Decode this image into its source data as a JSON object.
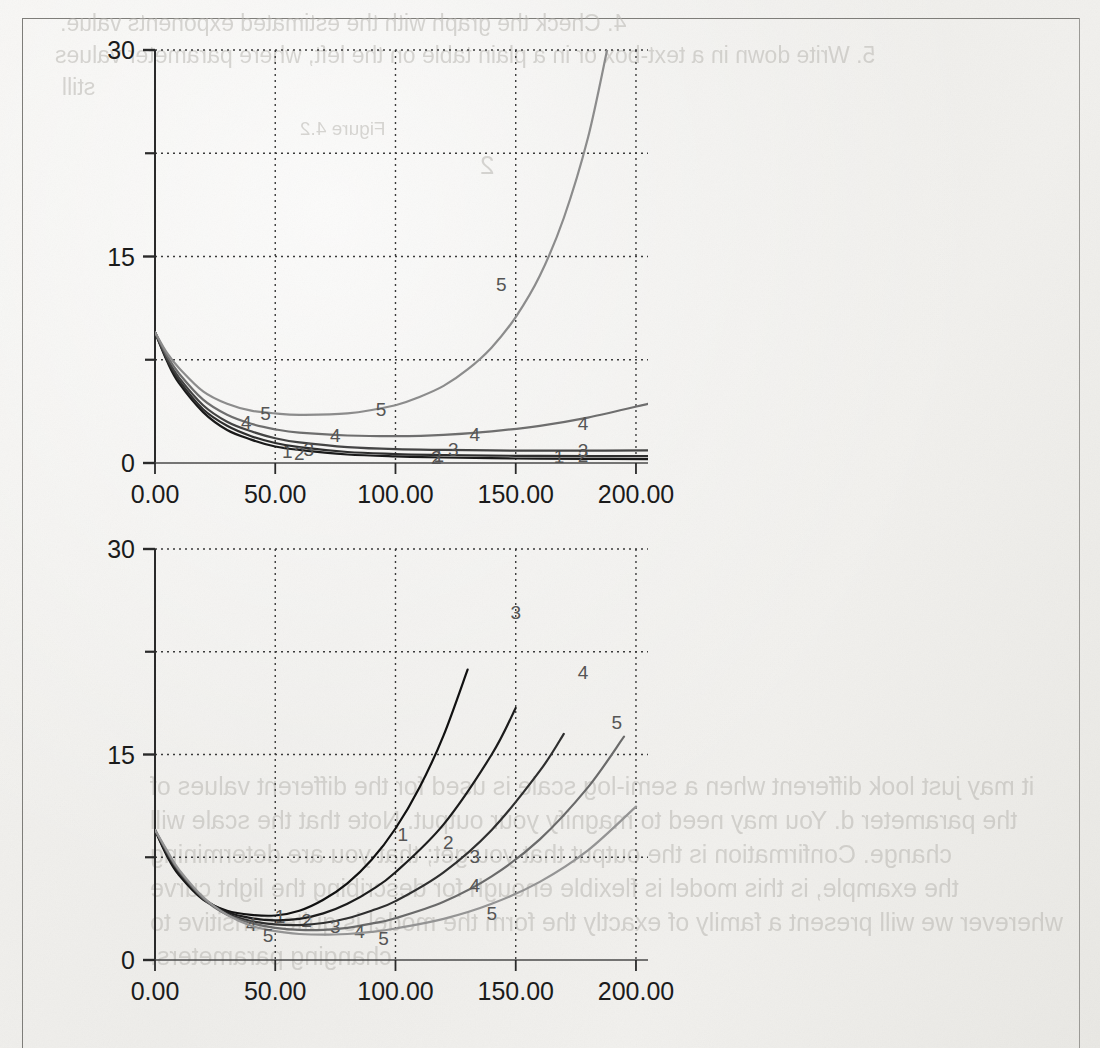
{
  "page": {
    "kind": "scanned-book-page",
    "background_color": "#f2f1ee",
    "frame_color": "#7e7d79"
  },
  "ghost_text": [
    {
      "text": "4. Check the graph with the estimated exponents value.",
      "x": 60,
      "y": 10,
      "size": 23
    },
    {
      "text": "5. Write down in a text-box or in a plain table on the left, where parameter values",
      "x": 55,
      "y": 42,
      "size": 23
    },
    {
      "text": "still",
      "x": 62,
      "y": 74,
      "size": 23
    },
    {
      "text": "Figure 4.2",
      "x": 300,
      "y": 118,
      "size": 19
    },
    {
      "text": "2",
      "x": 480,
      "y": 150,
      "size": 26
    },
    {
      "text": "it may just look different when a semi-log scale is used for the different values of",
      "x": 150,
      "y": 772,
      "size": 25
    },
    {
      "text": "the parameter d. You may need to magnify your output. Note that the scale will",
      "x": 150,
      "y": 806,
      "size": 25
    },
    {
      "text": "change. Confirmation is the output that you get; that you are determining",
      "x": 150,
      "y": 840,
      "size": 25
    },
    {
      "text": "the example, is this model is flexible enough for describing the light curve",
      "x": 150,
      "y": 874,
      "size": 25
    },
    {
      "text": "wherever we will present a family of exactly the form the model is quite sensitive to",
      "x": 150,
      "y": 908,
      "size": 25
    },
    {
      "text": "changing parameters.",
      "x": 150,
      "y": 942,
      "size": 25
    }
  ],
  "chart_data": [
    {
      "id": "chart-upper",
      "type": "line",
      "title": "",
      "xlabel": "",
      "ylabel": "",
      "xlim": [
        0,
        205
      ],
      "ylim": [
        0,
        30
      ],
      "xticks": [
        0,
        50,
        100,
        150,
        200
      ],
      "xtick_labels": [
        "0.00",
        "50.00",
        "100.00",
        "150.00",
        "200.00"
      ],
      "yticks": [
        0,
        15,
        30
      ],
      "ytick_labels": [
        "0",
        "15",
        "30"
      ],
      "minor_yticks": [
        7.5,
        22.5
      ],
      "grid": "dotted",
      "legend": "inline-curve-labels",
      "series": [
        {
          "name": "1",
          "color": "#1a1a1a",
          "label_points": [
            [
              55,
              0.9
            ],
            [
              118,
              0.55
            ],
            [
              168,
              0.5
            ]
          ],
          "x": [
            0,
            5,
            10,
            20,
            30,
            40,
            50,
            60,
            80,
            100,
            120,
            150,
            180,
            205
          ],
          "y": [
            9.5,
            7.4,
            5.8,
            3.7,
            2.4,
            1.7,
            1.2,
            0.95,
            0.62,
            0.48,
            0.4,
            0.33,
            0.3,
            0.28
          ]
        },
        {
          "name": "2",
          "color": "#2e2e2e",
          "label_points": [
            [
              60,
              0.75
            ],
            [
              117,
              0.45
            ],
            [
              178,
              0.6
            ]
          ],
          "x": [
            0,
            5,
            10,
            20,
            30,
            40,
            50,
            60,
            80,
            100,
            120,
            150,
            180,
            205
          ],
          "y": [
            9.5,
            7.5,
            6.0,
            3.9,
            2.7,
            1.95,
            1.45,
            1.15,
            0.8,
            0.65,
            0.58,
            0.52,
            0.5,
            0.5
          ]
        },
        {
          "name": "3",
          "color": "#444444",
          "label_points": [
            [
              64,
              1.05
            ],
            [
              124,
              1.0
            ],
            [
              178,
              0.95
            ]
          ],
          "x": [
            0,
            5,
            10,
            20,
            30,
            40,
            50,
            60,
            80,
            100,
            120,
            150,
            180,
            205
          ],
          "y": [
            9.5,
            7.6,
            6.2,
            4.2,
            3.0,
            2.3,
            1.8,
            1.5,
            1.15,
            1.0,
            0.95,
            0.9,
            0.9,
            0.92
          ]
        },
        {
          "name": "4",
          "color": "#6e6e6e",
          "label_points": [
            [
              38,
              3.0
            ],
            [
              75,
              2.05
            ],
            [
              133,
              2.1
            ],
            [
              178,
              2.9
            ]
          ],
          "x": [
            0,
            5,
            10,
            20,
            30,
            40,
            50,
            60,
            80,
            100,
            120,
            140,
            160,
            180,
            205
          ],
          "y": [
            9.5,
            7.8,
            6.5,
            4.6,
            3.5,
            2.85,
            2.45,
            2.2,
            2.0,
            1.95,
            2.05,
            2.3,
            2.7,
            3.3,
            4.3
          ]
        },
        {
          "name": "5",
          "color": "#8c8c8c",
          "label_points": [
            [
              46,
              3.6
            ],
            [
              94,
              3.9
            ],
            [
              144,
              13.0
            ]
          ],
          "x": [
            0,
            5,
            10,
            20,
            30,
            40,
            50,
            60,
            80,
            100,
            110,
            120,
            130,
            140,
            150,
            160,
            170,
            180,
            188
          ],
          "y": [
            9.5,
            8.0,
            6.9,
            5.2,
            4.3,
            3.8,
            3.6,
            3.5,
            3.6,
            4.2,
            4.8,
            5.6,
            6.8,
            8.4,
            10.6,
            13.6,
            17.8,
            23.6,
            30.0
          ]
        }
      ]
    },
    {
      "id": "chart-lower",
      "type": "line",
      "title": "",
      "xlabel": "",
      "ylabel": "",
      "xlim": [
        0,
        205
      ],
      "ylim": [
        0,
        30
      ],
      "xticks": [
        0,
        50,
        100,
        150,
        200
      ],
      "xtick_labels": [
        "0.00",
        "50.00",
        "100.00",
        "150.00",
        "200.00"
      ],
      "yticks": [
        0,
        15,
        30
      ],
      "ytick_labels": [
        "0",
        "15",
        "30"
      ],
      "minor_yticks": [
        7.5,
        22.5
      ],
      "grid": "dotted",
      "legend": "inline-curve-labels",
      "series": [
        {
          "name": "1",
          "color": "#111111",
          "label_points": [
            [
              52,
              3.2
            ],
            [
              103,
              9.2
            ]
          ],
          "x": [
            0,
            5,
            10,
            20,
            30,
            40,
            50,
            60,
            70,
            80,
            90,
            100,
            110,
            120,
            130
          ],
          "y": [
            9.5,
            7.6,
            6.2,
            4.4,
            3.6,
            3.3,
            3.25,
            3.6,
            4.4,
            5.6,
            7.3,
            9.6,
            12.6,
            16.4,
            21.2
          ]
        },
        {
          "name": "2",
          "color": "#1c1c1c",
          "label_points": [
            [
              63,
              2.9
            ],
            [
              122,
              8.6
            ]
          ],
          "x": [
            0,
            5,
            10,
            20,
            30,
            40,
            50,
            60,
            70,
            80,
            90,
            100,
            120,
            140,
            150
          ],
          "y": [
            9.5,
            7.7,
            6.3,
            4.5,
            3.5,
            3.05,
            2.9,
            3.0,
            3.4,
            4.1,
            5.1,
            6.4,
            9.9,
            15.0,
            18.4
          ]
        },
        {
          "name": "3",
          "color": "#2f2f2f",
          "label_points": [
            [
              75,
              2.5
            ],
            [
              133,
              7.6
            ],
            [
              150,
              25.4
            ]
          ],
          "x": [
            0,
            5,
            10,
            20,
            30,
            40,
            50,
            60,
            70,
            80,
            90,
            100,
            120,
            140,
            160,
            170
          ],
          "y": [
            9.5,
            7.8,
            6.4,
            4.5,
            3.4,
            2.85,
            2.6,
            2.55,
            2.7,
            3.05,
            3.6,
            4.3,
            6.4,
            9.5,
            13.8,
            16.5
          ]
        },
        {
          "name": "4",
          "color": "#6a6a6a",
          "label_points": [
            [
              40,
              2.6
            ],
            [
              85,
              2.15
            ],
            [
              133,
              5.5
            ],
            [
              178,
              21.0
            ]
          ],
          "x": [
            0,
            5,
            10,
            20,
            30,
            40,
            50,
            60,
            70,
            80,
            90,
            100,
            120,
            140,
            160,
            180,
            195
          ],
          "y": [
            9.5,
            7.9,
            6.5,
            4.5,
            3.3,
            2.7,
            2.35,
            2.2,
            2.2,
            2.35,
            2.65,
            3.05,
            4.25,
            6.1,
            8.8,
            12.6,
            16.3
          ]
        },
        {
          "name": "5",
          "color": "#949494",
          "label_points": [
            [
              47,
              1.85
            ],
            [
              95,
              1.6
            ],
            [
              140,
              3.4
            ],
            [
              192,
              17.4
            ]
          ],
          "x": [
            0,
            5,
            10,
            20,
            30,
            40,
            50,
            60,
            70,
            80,
            90,
            100,
            120,
            140,
            160,
            180,
            200
          ],
          "y": [
            9.5,
            8.0,
            6.6,
            4.6,
            3.3,
            2.5,
            2.1,
            1.9,
            1.85,
            1.9,
            2.05,
            2.3,
            3.0,
            4.1,
            5.7,
            8.0,
            11.2
          ]
        }
      ]
    }
  ]
}
